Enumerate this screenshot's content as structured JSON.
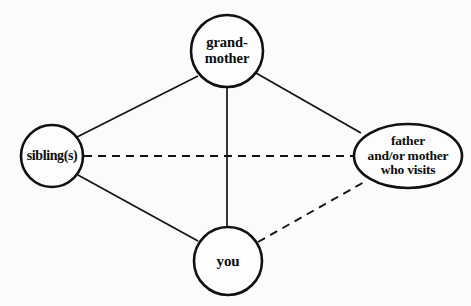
{
  "diagram": {
    "type": "relationship-network-diagram",
    "background_color": "#fbfbfb",
    "stroke_color": "#111111",
    "nodes": [
      {
        "id": "grandmother",
        "shape": "circle",
        "label_lines": [
          "grand-",
          "mother"
        ],
        "cx": 227,
        "cy": 51,
        "r": 36
      },
      {
        "id": "siblings",
        "shape": "circle",
        "label_lines": [
          "sibling(s)"
        ],
        "cx": 52,
        "cy": 156,
        "r": 31
      },
      {
        "id": "visiting-parent",
        "shape": "ellipse",
        "label_lines": [
          "father",
          "and/or mother",
          "who visits"
        ],
        "cx": 408,
        "cy": 156,
        "rx": 54,
        "ry": 32
      },
      {
        "id": "you",
        "shape": "circle",
        "label_lines": [
          "you"
        ],
        "cx": 228,
        "cy": 261,
        "r": 34
      }
    ],
    "edges": [
      {
        "id": "siblings-grandmother",
        "from": "siblings",
        "to": "grandmother",
        "style": "solid",
        "x1": 77,
        "y1": 137,
        "x2": 198,
        "y2": 76
      },
      {
        "id": "grandmother-visiting-parent",
        "from": "grandmother",
        "to": "visiting-parent",
        "style": "solid",
        "x1": 256,
        "y1": 73,
        "x2": 361,
        "y2": 133
      },
      {
        "id": "siblings-you",
        "from": "siblings",
        "to": "you",
        "style": "solid",
        "x1": 78,
        "y1": 175,
        "x2": 198,
        "y2": 241
      },
      {
        "id": "grandmother-you",
        "from": "grandmother",
        "to": "you",
        "style": "solid",
        "x1": 227,
        "y1": 87,
        "x2": 227,
        "y2": 227
      },
      {
        "id": "siblings-visiting-parent",
        "from": "siblings",
        "to": "visiting-parent",
        "style": "dashed",
        "x1": 84,
        "y1": 156,
        "x2": 354,
        "y2": 156
      },
      {
        "id": "you-visiting-parent",
        "from": "you",
        "to": "visiting-parent",
        "style": "dashed",
        "x1": 258,
        "y1": 242,
        "x2": 366,
        "y2": 181
      }
    ]
  }
}
